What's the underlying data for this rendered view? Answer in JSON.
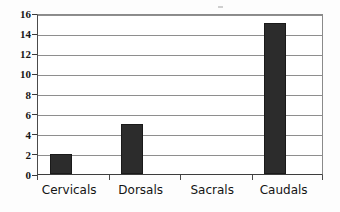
{
  "chart_data": {
    "type": "bar",
    "title": "",
    "subtitle": "",
    "xlabel": "",
    "ylabel": "",
    "categories": [
      "Cervicals",
      "Dorsals",
      "Sacrals",
      "Caudals"
    ],
    "values": [
      2,
      5,
      0,
      15
    ],
    "series": [
      {
        "name": "Vertebrae count",
        "values": [
          2,
          5,
          0,
          15
        ]
      }
    ],
    "ylim": [
      0,
      16
    ],
    "y_ticks": [
      0,
      2,
      4,
      6,
      8,
      10,
      12,
      14,
      16
    ],
    "y_tick_labels": [
      "0",
      "2",
      "4",
      "6",
      "8",
      "10",
      "12",
      "14",
      "16"
    ],
    "grid": true,
    "grid_axis": "y",
    "legend": false,
    "legend_position": "none",
    "bar_color": "#2c2c2c",
    "grid_color": "#8e8e8e",
    "axis_color": "#3d3d3d",
    "background_color": "#ffffff",
    "annotations": []
  }
}
